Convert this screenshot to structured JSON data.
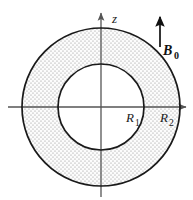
{
  "figure": {
    "background_color": "#ffffff",
    "width": 193,
    "height": 200
  },
  "axes": {
    "vertical": {
      "label": "z",
      "label_x": 112,
      "label_y": 22,
      "x": 101,
      "y_top": 13,
      "y_bottom": 197,
      "arrow": "up",
      "color": "#555555"
    },
    "horizontal": {
      "label": "",
      "y": 107,
      "x_left": 8,
      "x_right": 186,
      "arrow": "right",
      "color": "#555555"
    },
    "origin": {
      "x": 101,
      "y": 107
    }
  },
  "shapes": {
    "outer_circle": {
      "name": "outer-boundary",
      "cx": 101,
      "cy": 107,
      "r": 79,
      "stroke": "#1a1a1a",
      "stroke_width": 1.6
    },
    "inner_circle": {
      "name": "inner-boundary",
      "cx": 101,
      "cy": 107,
      "r": 43,
      "stroke": "#1a1a1a",
      "stroke_width": 1.6
    },
    "annulus_fill": {
      "pattern": "stipple-dots",
      "dot_color": "#8c8c8c",
      "base_color": "#fbfbfb"
    }
  },
  "labels": {
    "radius_inner": {
      "base": "R",
      "subscript": "1",
      "x": 126,
      "y": 122
    },
    "radius_outer": {
      "base": "R",
      "subscript": "2",
      "x": 160,
      "y": 122
    },
    "field": {
      "base": "B",
      "subscript": "0",
      "x": 165,
      "y": 54
    },
    "axis_vertical": {
      "base": "z"
    }
  },
  "field_arrow": {
    "name": "b0-arrow",
    "x": 160,
    "y_tail": 47,
    "y_head": 17,
    "direction": "up",
    "color": "#111111",
    "stroke_width": 1.6
  },
  "colors": {
    "ink": "#1a1a1a",
    "axis": "#555555",
    "stipple": "#8c8c8c",
    "background": "#ffffff"
  }
}
